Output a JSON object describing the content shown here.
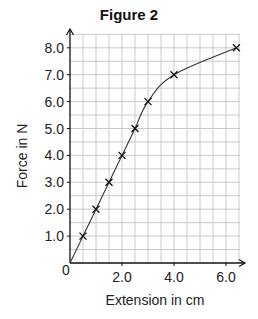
{
  "chart_data": {
    "type": "line",
    "title": "Figure 2",
    "xlabel": "Extension in cm",
    "ylabel": "Force in N",
    "x": [
      0,
      0.5,
      1.0,
      1.5,
      2.0,
      2.5,
      3.0,
      4.0,
      6.4
    ],
    "series": [
      {
        "name": "Force vs Extension",
        "values": [
          0,
          1.0,
          2.0,
          3.0,
          4.0,
          5.0,
          6.0,
          7.0,
          8.0
        ],
        "markers": "x"
      }
    ],
    "xticks": [
      "0",
      "2.0",
      "4.0",
      "6.0"
    ],
    "xtick_values": [
      0,
      2,
      4,
      6
    ],
    "yticks": [
      "1.0",
      "2.0",
      "3.0",
      "4.0",
      "5.0",
      "6.0",
      "7.0",
      "8.0"
    ],
    "ytick_values": [
      1,
      2,
      3,
      4,
      5,
      6,
      7,
      8
    ],
    "xlim": [
      0,
      6.6
    ],
    "ylim": [
      0,
      8.5
    ],
    "grid": true,
    "grid_minor_step_x": 0.5,
    "grid_minor_step_y": 0.5,
    "legend": "none",
    "origin_label": "0"
  }
}
